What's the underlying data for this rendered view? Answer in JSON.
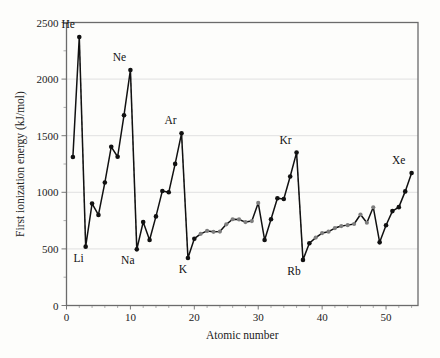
{
  "chart_data": {
    "type": "line",
    "title": "",
    "xlabel": "Atomic number",
    "ylabel": "First ionization energy (kJ/mol)",
    "xlim": [
      0,
      55
    ],
    "ylim": [
      0,
      2500
    ],
    "xticks": [
      0,
      10,
      20,
      30,
      40,
      50
    ],
    "yticks": [
      0,
      500,
      1000,
      1500,
      2000,
      2500
    ],
    "grid": "horizontal",
    "legend": "none",
    "x": [
      1,
      2,
      3,
      4,
      5,
      6,
      7,
      8,
      9,
      10,
      11,
      12,
      13,
      14,
      15,
      16,
      17,
      18,
      19,
      20,
      21,
      22,
      23,
      24,
      25,
      26,
      27,
      28,
      29,
      30,
      31,
      32,
      33,
      34,
      35,
      36,
      37,
      38,
      39,
      40,
      41,
      42,
      43,
      44,
      45,
      46,
      47,
      48,
      49,
      50,
      51,
      52,
      53,
      54
    ],
    "values": [
      1312,
      2372,
      520,
      900,
      800,
      1086,
      1402,
      1314,
      1681,
      2081,
      496,
      738,
      578,
      787,
      1012,
      1000,
      1251,
      1521,
      419,
      590,
      633,
      659,
      651,
      653,
      717,
      762,
      760,
      737,
      746,
      906,
      579,
      762,
      947,
      941,
      1140,
      1351,
      403,
      550,
      600,
      640,
      652,
      684,
      702,
      710,
      720,
      804,
      731,
      868,
      558,
      709,
      834,
      869,
      1008,
      1170
    ],
    "series_name": "First ionization energy",
    "highlight_group_gray": {
      "label": "transition-metals",
      "x": [
        21,
        22,
        23,
        24,
        25,
        26,
        27,
        28,
        29,
        30,
        39,
        40,
        41,
        42,
        43,
        44,
        45,
        46,
        47,
        48
      ],
      "color": "#7e7e7e"
    },
    "annotations": [
      {
        "text": "He",
        "x": 2,
        "y": 2372,
        "dx": -11,
        "dy": -9
      },
      {
        "text": "Ne",
        "x": 10,
        "y": 2081,
        "dx": -11,
        "dy": -9
      },
      {
        "text": "Ar",
        "x": 18,
        "y": 1521,
        "dx": -11,
        "dy": -9
      },
      {
        "text": "Kr",
        "x": 36,
        "y": 1351,
        "dx": -11,
        "dy": -9
      },
      {
        "text": "Xe",
        "x": 54,
        "y": 1170,
        "dx": -13,
        "dy": -9
      },
      {
        "text": "Li",
        "x": 3,
        "y": 520,
        "dx": -7,
        "dy": 15
      },
      {
        "text": "Na",
        "x": 11,
        "y": 496,
        "dx": -9,
        "dy": 15
      },
      {
        "text": "K",
        "x": 19,
        "y": 419,
        "dx": -5,
        "dy": 15
      },
      {
        "text": "Rb",
        "x": 37,
        "y": 403,
        "dx": -9,
        "dy": 15
      }
    ],
    "dashed_connectors": [
      {
        "from_x": 2,
        "from_y": 2372,
        "to_x": 3,
        "to_y": 520
      },
      {
        "from_x": 10,
        "from_y": 2081,
        "to_x": 11,
        "to_y": 496
      },
      {
        "from_x": 18,
        "from_y": 1521,
        "to_x": 19,
        "to_y": 419
      },
      {
        "from_x": 36,
        "from_y": 1351,
        "to_x": 37,
        "to_y": 403
      }
    ],
    "colors": {
      "line": "#111111",
      "marker": "#111111",
      "marker_transition": "#7e7e7e",
      "grid": "#d9d9d9",
      "frame": "#6b6b6b",
      "background": "#fdfdfb"
    }
  }
}
